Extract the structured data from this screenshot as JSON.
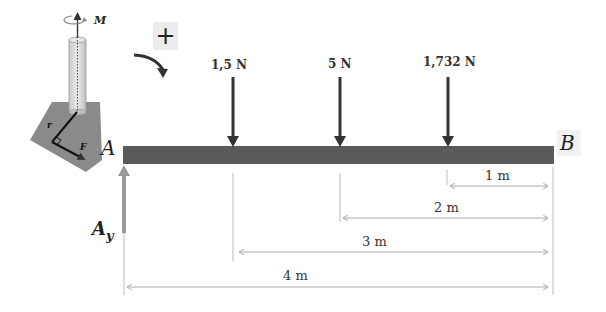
{
  "diagram": {
    "sign_convention": {
      "label": "+",
      "direction": "clockwise"
    },
    "inset": {
      "moment_label": "M",
      "position_vector_label": "r",
      "force_label": "F"
    },
    "beam": {
      "left_label": "A",
      "right_label": "B",
      "color": "#5a5a5a"
    },
    "reaction": {
      "label_main": "A",
      "label_sub": "y",
      "color": "#9a9a9a"
    },
    "loads": [
      {
        "label": "1,5 N",
        "distance_from_B_m": 3
      },
      {
        "label": "5 N",
        "distance_from_B_m": 2
      },
      {
        "label": "1,732 N",
        "distance_from_B_m": 1
      }
    ],
    "dimensions": [
      {
        "label": "1 m"
      },
      {
        "label": "2 m"
      },
      {
        "label": "3 m"
      },
      {
        "label": "4 m"
      }
    ]
  }
}
